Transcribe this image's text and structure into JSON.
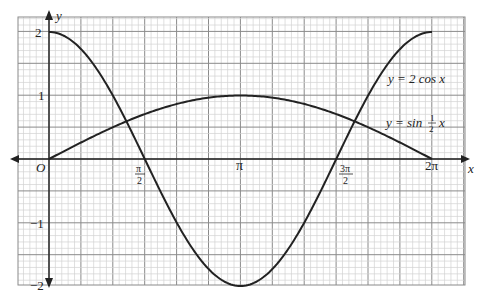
{
  "chart_data": {
    "type": "line",
    "title": "",
    "xlabel": "x",
    "ylabel": "y",
    "xlim": [
      0,
      6.2832
    ],
    "ylim": [
      -2,
      2
    ],
    "grid": true,
    "x_ticks": [
      "O",
      "π/2",
      "π",
      "3π/2",
      "2π"
    ],
    "y_ticks": [
      "2",
      "1",
      "-1",
      "-2"
    ],
    "series": [
      {
        "name": "y = 2 cos x",
        "x": [
          0,
          0.7854,
          1.5708,
          2.3562,
          3.1416,
          3.927,
          4.7124,
          5.4978,
          6.2832
        ],
        "values": [
          2,
          1.414,
          0,
          -1.414,
          -2,
          -1.414,
          0,
          1.414,
          2
        ]
      },
      {
        "name": "y = sin ½x",
        "x": [
          0,
          0.7854,
          1.5708,
          2.3562,
          3.1416,
          3.927,
          4.7124,
          5.4978,
          6.2832
        ],
        "values": [
          0,
          0.383,
          0.707,
          0.924,
          1,
          0.924,
          0.707,
          0.383,
          0
        ]
      }
    ],
    "annotations": [
      {
        "text": "y = 2 cos x",
        "near": [
          5.3,
          1.1
        ]
      },
      {
        "text": "y = sin ½ x",
        "near": [
          5.5,
          0.3
        ]
      }
    ]
  },
  "labels": {
    "y_axis": "y",
    "x_axis": "x",
    "origin": "O",
    "y2": "2",
    "y1": "1",
    "ym1": "−1",
    "ym2": "−2",
    "pi": "π",
    "two_pi": "2π",
    "half_pi_num": "π",
    "half_pi_den": "2",
    "three_half_pi_num": "3π",
    "three_half_pi_den": "2",
    "cos_label": "y = 2 cos x",
    "sin_label_pre": "y = sin",
    "sin_frac_num": "1",
    "sin_frac_den": "2",
    "sin_label_post": "x"
  }
}
